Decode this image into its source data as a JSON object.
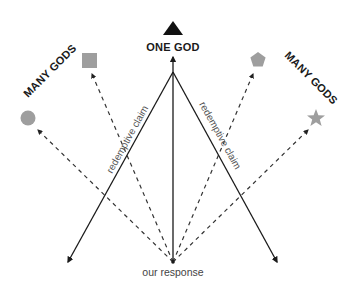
{
  "diagram": {
    "top_label": "ONE GOD",
    "left_group_label": "MANY GODS",
    "right_group_label": "MANY GODS",
    "left_claim_label": "redemptive claim",
    "right_claim_label": "redemptive claim",
    "origin_label": "our response",
    "shapes": {
      "top": "triangle",
      "left_upper": "square",
      "left_lower": "circle",
      "right_upper": "pentagon",
      "right_lower": "star"
    },
    "colors": {
      "solid_line": "#1a1a1a",
      "dashed_line": "#333333",
      "triangle": "#111111",
      "gray_shapes": "#9e9e9e"
    }
  }
}
